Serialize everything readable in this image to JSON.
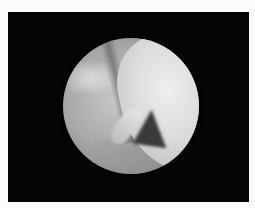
{
  "image": {
    "description": "Arthroscopic circular view on black background",
    "frame_color": "#050505",
    "border_color": "#fbfbfb",
    "scope_view": {
      "shape": "circle",
      "center": [
        131,
        106
      ],
      "radius": 68
    }
  }
}
